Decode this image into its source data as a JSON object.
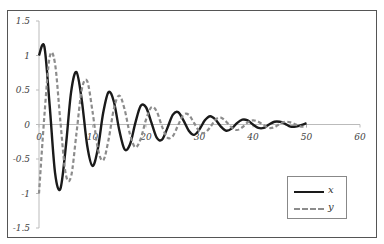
{
  "chart_data": {
    "type": "line",
    "title": "",
    "xlabel": "",
    "ylabel": "",
    "xlim": [
      0,
      60
    ],
    "ylim": [
      -1.5,
      1.5
    ],
    "x_ticks": [
      "0",
      "10",
      "20",
      "30",
      "40",
      "50",
      "60"
    ],
    "y_ticks": [
      "1.5",
      "1",
      "0.5",
      "0",
      "-0.5",
      "-1",
      "-1.5"
    ],
    "grid": false,
    "legend_position": "lower right",
    "x": [
      0,
      1,
      2,
      3,
      4,
      5,
      6,
      7,
      8,
      9,
      10,
      11,
      12,
      13,
      14,
      15,
      16,
      17,
      18,
      19,
      20,
      21,
      22,
      23,
      24,
      25,
      26,
      27,
      28,
      29,
      30,
      31,
      32,
      33,
      34,
      35,
      36,
      37,
      38,
      39,
      40,
      41,
      42,
      43,
      44,
      45,
      46,
      47,
      48,
      49,
      50
    ],
    "series": [
      {
        "name": "x",
        "style": "solid",
        "color": "#1a1a1a",
        "values": [
          1.0,
          1.13,
          0.27,
          -0.7,
          -0.93,
          -0.33,
          0.47,
          0.76,
          0.35,
          -0.3,
          -0.6,
          -0.35,
          0.17,
          0.47,
          0.33,
          -0.08,
          -0.36,
          -0.29,
          0.02,
          0.27,
          0.25,
          0.03,
          -0.19,
          -0.22,
          -0.05,
          0.14,
          0.18,
          0.06,
          -0.09,
          -0.15,
          -0.07,
          0.06,
          0.12,
          0.07,
          -0.03,
          -0.09,
          -0.06,
          0.02,
          0.07,
          0.06,
          0.0,
          -0.05,
          -0.05,
          0.0,
          0.04,
          0.04,
          0.01,
          -0.03,
          -0.03,
          -0.01,
          0.02
        ]
      },
      {
        "name": "y",
        "style": "dashed",
        "color": "#8c8c8c",
        "values": [
          -1.0,
          0.12,
          0.98,
          0.88,
          0.04,
          -0.72,
          -0.75,
          -0.13,
          0.51,
          0.63,
          0.19,
          -0.35,
          -0.52,
          -0.22,
          0.23,
          0.42,
          0.22,
          -0.14,
          -0.33,
          -0.21,
          0.07,
          0.25,
          0.19,
          -0.03,
          -0.19,
          -0.17,
          -0.01,
          0.14,
          0.14,
          0.02,
          -0.1,
          -0.12,
          -0.04,
          0.07,
          0.1,
          0.04,
          -0.04,
          -0.08,
          -0.04,
          0.03,
          0.06,
          0.04,
          -0.01,
          -0.05,
          -0.04,
          0.01,
          0.04,
          0.03,
          0.0,
          -0.03,
          -0.03
        ]
      }
    ]
  },
  "legend": {
    "items": [
      {
        "label": "x"
      },
      {
        "label": "y"
      }
    ]
  }
}
